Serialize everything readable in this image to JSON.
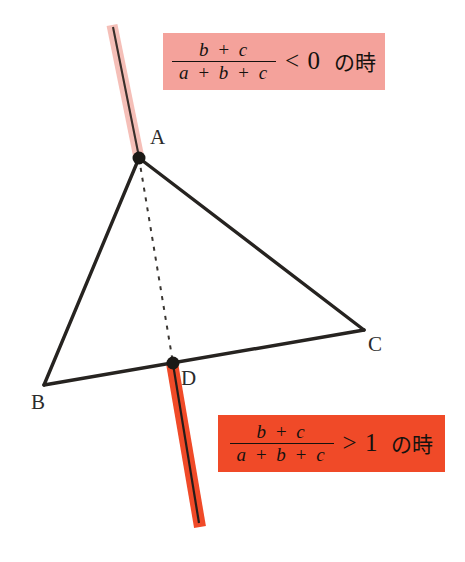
{
  "figure": {
    "title_alt": "Triangle ABC with cevian AD extended, two ratio conditions",
    "background_color": "#ffffff",
    "vertices": [
      {
        "name": "A",
        "label": "A",
        "x": 139,
        "y": 158,
        "label_x": 150,
        "label_y": 127
      },
      {
        "name": "B",
        "label": "B",
        "x": 44,
        "y": 385,
        "label_x": 31,
        "label_y": 392
      },
      {
        "name": "C",
        "label": "C",
        "x": 364,
        "y": 330,
        "label_x": 368,
        "label_y": 334
      },
      {
        "name": "D",
        "label": "D",
        "x": 173,
        "y": 363,
        "label_x": 181,
        "label_y": 368
      }
    ],
    "edges": [
      {
        "name": "edge-AB",
        "from": "A",
        "to": "B"
      },
      {
        "name": "edge-BC",
        "from": "B",
        "to": "C"
      },
      {
        "name": "edge-AC",
        "from": "A",
        "to": "C"
      }
    ],
    "dashed_segment": {
      "name": "segment-AD",
      "from": "A",
      "to": "D"
    },
    "ray_above_A": {
      "name": "ray-above-a",
      "color": "#f5bfb8",
      "core_color": "#3a2f2b",
      "x1": 112,
      "y1": 25,
      "x2": 139,
      "y2": 158
    },
    "ray_below_D": {
      "name": "ray-below-d",
      "color": "#f04a28",
      "core_color": "#231c19",
      "x1": 173,
      "y1": 363,
      "x2": 200,
      "y2": 527
    },
    "line_color": "#262320",
    "dash_color": "#3a3632"
  },
  "callouts": {
    "top": {
      "name": "condition-negative",
      "background": "#f4a29b",
      "numerator": "b + c",
      "denominator": "a + b + c",
      "relation": "< 0",
      "condition_text": "の時"
    },
    "bottom": {
      "name": "condition-greater-than-one",
      "background": "#f04a28",
      "numerator": "b + c",
      "denominator": "a + b + c",
      "relation": "> 1",
      "condition_text": "の時"
    }
  }
}
